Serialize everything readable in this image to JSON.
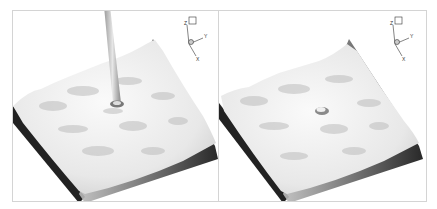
{
  "figure": {
    "panels": [
      {
        "id": "left",
        "description": "3D rendered wavy surface slab with vertical jet column impinging at center",
        "has_jet": true,
        "axes_triad": {
          "labels": [
            "Z",
            "Y",
            "X"
          ]
        }
      },
      {
        "id": "right",
        "description": "3D rendered wavy surface slab with small bump at center (no jet)",
        "has_jet": false,
        "axes_triad": {
          "labels": [
            "Z",
            "Y",
            "X"
          ]
        }
      }
    ],
    "colors": {
      "surface_light": "#f2f2f2",
      "surface_shadow": "#1a1a1a",
      "border": "#d4d4d4",
      "background": "#ffffff"
    }
  }
}
